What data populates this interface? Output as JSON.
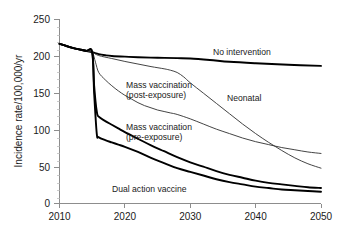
{
  "chart_data": {
    "type": "line",
    "title": "",
    "xlabel": "",
    "ylabel": "Incidence rate/100,000/yr",
    "xlim": [
      2010,
      2050
    ],
    "ylim": [
      0,
      250
    ],
    "xticks": [
      "2010",
      "2020",
      "2030",
      "2040",
      "2050"
    ],
    "yticks": [
      "0",
      "50",
      "100",
      "150",
      "200",
      "250"
    ],
    "grid": false,
    "legend_position": "inline-annotations",
    "series": [
      {
        "name": "No intervention",
        "label": "No intervention",
        "weight": "thick",
        "points": [
          [
            2010,
            217
          ],
          [
            2011,
            214
          ],
          [
            2012,
            211.5
          ],
          [
            2013,
            209.5
          ],
          [
            2014,
            207.5
          ],
          [
            2015,
            205.5
          ],
          [
            2016,
            203
          ],
          [
            2017,
            201.5
          ],
          [
            2018,
            200.5
          ],
          [
            2020,
            199.5
          ],
          [
            2022,
            198.8
          ],
          [
            2025,
            198
          ],
          [
            2028,
            197.5
          ],
          [
            2030,
            197
          ],
          [
            2033,
            195
          ],
          [
            2036,
            192.5
          ],
          [
            2040,
            190.5
          ],
          [
            2045,
            188.5
          ],
          [
            2050,
            187
          ]
        ]
      },
      {
        "name": "Neonatal",
        "label": "Neonatal",
        "weight": "thin",
        "points": [
          [
            2010,
            217
          ],
          [
            2012,
            211.5
          ],
          [
            2014,
            207.5
          ],
          [
            2015,
            205.5
          ],
          [
            2016,
            201
          ],
          [
            2018,
            197
          ],
          [
            2020,
            193
          ],
          [
            2022,
            189.5
          ],
          [
            2024,
            186
          ],
          [
            2026,
            183
          ],
          [
            2027,
            181
          ],
          [
            2028,
            178
          ],
          [
            2029,
            172
          ],
          [
            2030,
            164
          ],
          [
            2032,
            150
          ],
          [
            2034,
            136
          ],
          [
            2036,
            122
          ],
          [
            2038,
            108
          ],
          [
            2040,
            95
          ],
          [
            2042,
            83
          ],
          [
            2044,
            72
          ],
          [
            2046,
            62
          ],
          [
            2048,
            54
          ],
          [
            2050,
            48
          ]
        ]
      },
      {
        "name": "Mass vaccination (post-exposure)",
        "label": "Mass vaccination\n(post-exposure)",
        "weight": "thin",
        "points": [
          [
            2010,
            217
          ],
          [
            2012,
            211.5
          ],
          [
            2014,
            207.5
          ],
          [
            2015,
            205.5
          ],
          [
            2015.5,
            192
          ],
          [
            2016,
            178
          ],
          [
            2017,
            168
          ],
          [
            2018,
            160
          ],
          [
            2019,
            153
          ],
          [
            2020,
            147
          ],
          [
            2021,
            142
          ],
          [
            2022,
            137
          ],
          [
            2023,
            133
          ],
          [
            2024,
            130
          ],
          [
            2025,
            127
          ],
          [
            2026,
            125
          ],
          [
            2027,
            123
          ],
          [
            2028,
            121
          ],
          [
            2030,
            115
          ],
          [
            2032,
            108
          ],
          [
            2034,
            101
          ],
          [
            2036,
            95
          ],
          [
            2038,
            89
          ],
          [
            2040,
            84
          ],
          [
            2042,
            80
          ],
          [
            2044,
            76
          ],
          [
            2046,
            73
          ],
          [
            2048,
            70
          ],
          [
            2050,
            68
          ]
        ]
      },
      {
        "name": "Mass vaccination (pre-exposure)",
        "label": "Mass vaccination\n(pre-exposure)",
        "weight": "thick",
        "points": [
          [
            2010,
            217
          ],
          [
            2012,
            211.5
          ],
          [
            2014,
            207.5
          ],
          [
            2015,
            205.5
          ],
          [
            2015.3,
            160
          ],
          [
            2015.7,
            125
          ],
          [
            2016,
            118
          ],
          [
            2017,
            112
          ],
          [
            2018,
            107
          ],
          [
            2019,
            102
          ],
          [
            2020,
            97
          ],
          [
            2022,
            88
          ],
          [
            2024,
            79
          ],
          [
            2026,
            71
          ],
          [
            2028,
            63
          ],
          [
            2030,
            56
          ],
          [
            2032,
            50
          ],
          [
            2034,
            44
          ],
          [
            2036,
            39
          ],
          [
            2038,
            35
          ],
          [
            2040,
            31
          ],
          [
            2042,
            28
          ],
          [
            2044,
            26
          ],
          [
            2046,
            24
          ],
          [
            2048,
            22
          ],
          [
            2050,
            21
          ]
        ]
      },
      {
        "name": "Dual action vaccine",
        "label": "Dual action vaccine",
        "weight": "thick",
        "points": [
          [
            2010,
            217
          ],
          [
            2012,
            211.5
          ],
          [
            2014,
            207.5
          ],
          [
            2015,
            205.5
          ],
          [
            2015.3,
            150
          ],
          [
            2015.7,
            95
          ],
          [
            2016,
            90
          ],
          [
            2017,
            86
          ],
          [
            2018,
            83
          ],
          [
            2019,
            80
          ],
          [
            2020,
            77
          ],
          [
            2022,
            70
          ],
          [
            2024,
            62
          ],
          [
            2026,
            55
          ],
          [
            2028,
            48
          ],
          [
            2030,
            43
          ],
          [
            2032,
            38
          ],
          [
            2034,
            33
          ],
          [
            2036,
            29
          ],
          [
            2038,
            26
          ],
          [
            2040,
            23
          ],
          [
            2042,
            21
          ],
          [
            2044,
            19
          ],
          [
            2046,
            18
          ],
          [
            2048,
            17
          ],
          [
            2050,
            16
          ]
        ]
      }
    ],
    "annotations": [
      {
        "key": "no_intervention",
        "text": "No intervention",
        "x": 213,
        "y": 55
      },
      {
        "key": "neonatal",
        "text": "Neonatal",
        "x": 227,
        "y": 101
      },
      {
        "key": "mass_post_l1",
        "text": "Mass vaccination",
        "x": 126,
        "y": 88
      },
      {
        "key": "mass_post_l2",
        "text": "(post-exposure)",
        "x": 126,
        "y": 98
      },
      {
        "key": "mass_pre_l1",
        "text": "Mass vaccination",
        "x": 126,
        "y": 130
      },
      {
        "key": "mass_pre_l2",
        "text": "(pre-exposure)",
        "x": 126,
        "y": 140
      },
      {
        "key": "dual_action",
        "text": "Dual action vaccine",
        "x": 112,
        "y": 192
      }
    ]
  },
  "axes": {
    "y_title": "Incidence rate/100,000/yr",
    "y_ticks": [
      "250",
      "200",
      "150",
      "100",
      "50",
      "0"
    ],
    "x_ticks": [
      "2010",
      "2020",
      "2030",
      "2040",
      "2050"
    ]
  },
  "colors": {
    "curve_primary": "#000000",
    "curve_secondary": "#3a3a3a",
    "axis": "#8d8d8d",
    "text": "#1a1a1a",
    "background": "#ffffff"
  }
}
